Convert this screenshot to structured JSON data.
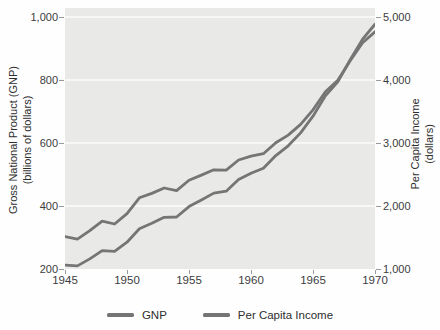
{
  "chart_data": {
    "type": "line",
    "title": "",
    "grid": true,
    "legend_position": "bottom",
    "plot_background": "#e9e9e8",
    "gridline_color": "#fbfbfb",
    "x_axis": {
      "label": "",
      "range": [
        1945,
        1970
      ],
      "ticks": [
        {
          "value": 1945,
          "label": "1945"
        },
        {
          "value": 1950,
          "label": "1950"
        },
        {
          "value": 1955,
          "label": "1955"
        },
        {
          "value": 1960,
          "label": "1960"
        },
        {
          "value": 1965,
          "label": "1965"
        },
        {
          "value": 1970,
          "label": "1970"
        }
      ]
    },
    "left_axis": {
      "title_line1": "Gross National Product (GNP)",
      "title_line2": "(billions of dollars)",
      "range": [
        200,
        1000
      ],
      "ticks": [
        {
          "value": 200,
          "label": "200"
        },
        {
          "value": 400,
          "label": "400"
        },
        {
          "value": 600,
          "label": "600"
        },
        {
          "value": 800,
          "label": "800"
        },
        {
          "value": 1000,
          "label": "1,000"
        }
      ]
    },
    "right_axis": {
      "title_line1": "Per Capita Income",
      "title_line2": "(dollars)",
      "range": [
        1000,
        5000
      ],
      "ticks": [
        {
          "value": 1000,
          "label": "1,000"
        },
        {
          "value": 2000,
          "label": "2,000"
        },
        {
          "value": 3000,
          "label": "3,000"
        },
        {
          "value": 4000,
          "label": "4,000"
        },
        {
          "value": 5000,
          "label": "5,000"
        }
      ]
    },
    "x": [
      1945,
      1946,
      1947,
      1948,
      1949,
      1950,
      1951,
      1952,
      1953,
      1954,
      1955,
      1956,
      1957,
      1958,
      1959,
      1960,
      1961,
      1962,
      1963,
      1964,
      1965,
      1966,
      1967,
      1968,
      1969,
      1970
    ],
    "series": [
      {
        "name": "GNP",
        "axis": "left",
        "color": "#757575",
        "values": [
          212,
          210,
          232,
          258,
          256,
          285,
          328,
          345,
          364,
          365,
          398,
          419,
          441,
          447,
          484,
          504,
          520,
          560,
          591,
          632,
          685,
          750,
          794,
          864,
          930,
          977
        ]
      },
      {
        "name": "Per Capita Income",
        "axis": "right",
        "color": "#757575",
        "values": [
          1515,
          1475,
          1610,
          1760,
          1715,
          1880,
          2130,
          2200,
          2285,
          2245,
          2410,
          2490,
          2575,
          2570,
          2730,
          2790,
          2830,
          3005,
          3125,
          3295,
          3525,
          3815,
          3995,
          4305,
          4590,
          4765
        ]
      }
    ]
  }
}
